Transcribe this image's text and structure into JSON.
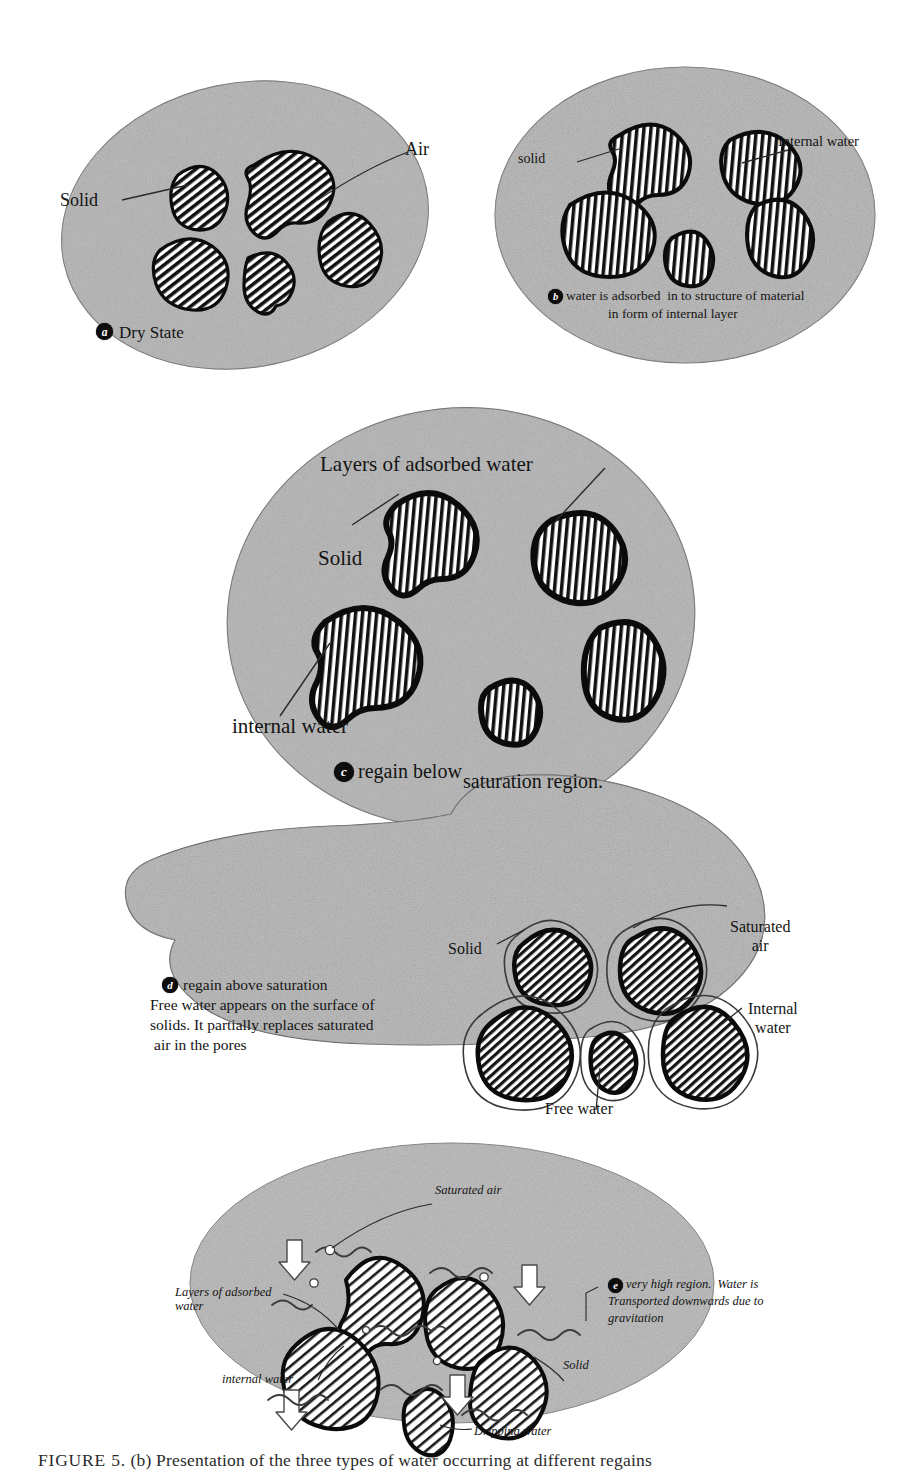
{
  "figure": {
    "caption_prefix": "FIGURE 5.",
    "caption_text": "(b) Presentation of the three types of water occurring at different regains",
    "caption_full": "FIGURE 5.  (b) Presentation of the three types of water occurring at different regains"
  },
  "colors": {
    "matrix_fill": "#d9d9d9",
    "matrix_stroke": "#6f6f6f",
    "solid_stroke": "#0b0b0b",
    "hatch": "#111111",
    "text": "#141414",
    "badge_bg": "#0d0d0d",
    "badge_fg": "#ffffff",
    "page_bg": "#ffffff"
  },
  "panels": [
    {
      "id": "a",
      "badge": "a",
      "shape": "ellipse",
      "title": "Dry State",
      "caption_lines": [
        "Dry State"
      ],
      "labels": [
        {
          "name": "solid",
          "text": "Solid"
        },
        {
          "name": "air",
          "text": "Air"
        }
      ],
      "solids_count": 5,
      "fill_style": "diagonal-hatch"
    },
    {
      "id": "b",
      "badge": "b",
      "shape": "ellipse",
      "title": "water is adsorbed in to structure of material in form of internal layer",
      "caption_lines": [
        "water is adsorbed  in to structure of material",
        "in form of internal layer"
      ],
      "labels": [
        {
          "name": "solid",
          "text": "solid"
        },
        {
          "name": "internal-water",
          "text": "Internal water"
        }
      ],
      "solids_count": 5,
      "fill_style": "vertical-hatch"
    },
    {
      "id": "c",
      "badge": "c",
      "shape": "ellipse",
      "title": "regain below saturation region.",
      "caption_lines": [
        "regain below",
        "saturation region."
      ],
      "labels": [
        {
          "name": "layers-of-adsorbed-water",
          "text": "Layers of adsorbed water"
        },
        {
          "name": "solid",
          "text": "Solid"
        },
        {
          "name": "internal-water",
          "text": "internal water"
        }
      ],
      "solids_count": 5,
      "fill_style": "vertical-hatch"
    },
    {
      "id": "d",
      "badge": "d",
      "shape": "blob",
      "title": "regain above saturation",
      "caption_lines": [
        "regain above saturation",
        "Free water appears on the surface of",
        "solids. It partially replaces saturated",
        "air in the pores"
      ],
      "labels": [
        {
          "name": "solid",
          "text": "Solid"
        },
        {
          "name": "saturated-air",
          "text": "Saturated\nair"
        },
        {
          "name": "internal-water",
          "text": "Internal\nwater"
        },
        {
          "name": "free-water",
          "text": "Free water"
        }
      ],
      "solids_count": 5,
      "fill_style": "diagonal-hatch-haloed"
    },
    {
      "id": "e",
      "badge": "e",
      "shape": "wide-ellipse",
      "title": "very high region. Water is Transported downwards due to gravitation",
      "caption_lines": [
        "very high region.  Water is",
        "Transported downwards due to",
        "gravitation"
      ],
      "labels": [
        {
          "name": "saturated-air",
          "text": "Saturated air"
        },
        {
          "name": "layers-of-adsorbed-water",
          "text": "Layers of adsorbed\nwater"
        },
        {
          "name": "internal-water",
          "text": "internal water"
        },
        {
          "name": "solid",
          "text": "Solid"
        },
        {
          "name": "dripping-water",
          "text": "Dripping water"
        }
      ],
      "solids_count": 5,
      "fill_style": "diagonal-hatch",
      "arrows": 4,
      "wavy_lines": 8,
      "bubbles": 5
    }
  ]
}
